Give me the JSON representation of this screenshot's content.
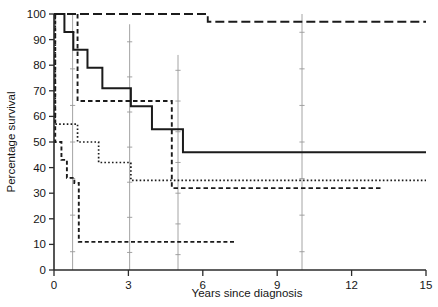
{
  "chart_data": {
    "type": "line",
    "title": "",
    "xlabel": "Years since diagnosis",
    "ylabel": "Percentage survival",
    "xlim": [
      0,
      15
    ],
    "ylim": [
      0,
      100
    ],
    "xticks": [
      0,
      3,
      6,
      9,
      12,
      15
    ],
    "yticks": [
      0,
      10,
      20,
      30,
      40,
      50,
      60,
      70,
      80,
      90,
      100
    ],
    "xtick_labels": [
      "0",
      "3",
      "6",
      "9",
      "12",
      "15"
    ],
    "ytick_labels": [
      "0",
      "10",
      "20",
      "30",
      "40",
      "50",
      "60",
      "70",
      "80",
      "90",
      "100"
    ],
    "grid": false,
    "legend": "none",
    "plot_style": "kaplan-meier-step",
    "series": [
      {
        "name": "group-1-solid",
        "line_style": "solid",
        "dash_pattern": "none",
        "stroke_width": 2.0,
        "points": [
          {
            "x": 0.0,
            "y": 100
          },
          {
            "x": 0.42,
            "y": 100
          },
          {
            "x": 0.42,
            "y": 93
          },
          {
            "x": 0.78,
            "y": 93
          },
          {
            "x": 0.78,
            "y": 86
          },
          {
            "x": 1.35,
            "y": 86
          },
          {
            "x": 1.35,
            "y": 79
          },
          {
            "x": 1.95,
            "y": 79
          },
          {
            "x": 1.95,
            "y": 71
          },
          {
            "x": 3.1,
            "y": 71
          },
          {
            "x": 3.1,
            "y": 64
          },
          {
            "x": 3.95,
            "y": 64
          },
          {
            "x": 3.95,
            "y": 55
          },
          {
            "x": 5.2,
            "y": 55
          },
          {
            "x": 5.2,
            "y": 46
          },
          {
            "x": 15.0,
            "y": 46
          }
        ],
        "final_value": 46
      },
      {
        "name": "group-2-long-dash",
        "line_style": "long-dash",
        "dash_pattern": "9 4",
        "stroke_width": 1.9,
        "points": [
          {
            "x": 0.0,
            "y": 100
          },
          {
            "x": 6.2,
            "y": 100
          },
          {
            "x": 6.2,
            "y": 97
          },
          {
            "x": 15.0,
            "y": 97
          }
        ],
        "final_value": 97
      },
      {
        "name": "group-3-dotted",
        "line_style": "dotted",
        "dash_pattern": "1.6 2.2",
        "stroke_width": 1.7,
        "points": [
          {
            "x": 0.05,
            "y": 100
          },
          {
            "x": 0.05,
            "y": 57
          },
          {
            "x": 0.95,
            "y": 57
          },
          {
            "x": 0.95,
            "y": 50
          },
          {
            "x": 1.8,
            "y": 50
          },
          {
            "x": 1.8,
            "y": 42
          },
          {
            "x": 3.1,
            "y": 42
          },
          {
            "x": 3.1,
            "y": 35
          },
          {
            "x": 15.0,
            "y": 35
          }
        ],
        "final_value": 35
      },
      {
        "name": "group-4-short-dash-upper",
        "line_style": "short-dash",
        "dash_pattern": "4.5 3",
        "stroke_width": 1.9,
        "points": [
          {
            "x": 0.95,
            "y": 100
          },
          {
            "x": 0.95,
            "y": 66
          },
          {
            "x": 4.75,
            "y": 66
          },
          {
            "x": 4.75,
            "y": 32
          },
          {
            "x": 13.2,
            "y": 32
          }
        ],
        "final_value": 32
      },
      {
        "name": "group-5-short-dash-lower",
        "line_style": "short-dash",
        "dash_pattern": "4 2.6",
        "stroke_width": 1.9,
        "points": [
          {
            "x": 0.05,
            "y": 100
          },
          {
            "x": 0.05,
            "y": 50
          },
          {
            "x": 0.3,
            "y": 50
          },
          {
            "x": 0.3,
            "y": 43
          },
          {
            "x": 0.52,
            "y": 43
          },
          {
            "x": 0.52,
            "y": 36
          },
          {
            "x": 0.82,
            "y": 36
          },
          {
            "x": 0.82,
            "y": 34
          },
          {
            "x": 1.0,
            "y": 34
          },
          {
            "x": 1.0,
            "y": 11
          },
          {
            "x": 7.35,
            "y": 11
          }
        ],
        "final_value": 11
      }
    ],
    "censor_marks": [
      {
        "x": 0.75,
        "y_top": 100,
        "y_bottom": 0
      },
      {
        "x": 3.05,
        "y_top": 96,
        "y_bottom": 0
      },
      {
        "x": 5.0,
        "y_top": 84,
        "y_bottom": 0
      },
      {
        "x": 10.0,
        "y_top": 100,
        "y_bottom": 0
      }
    ]
  },
  "axes": {
    "x_label": "Years since diagnosis",
    "y_label": "Percentage survival"
  }
}
